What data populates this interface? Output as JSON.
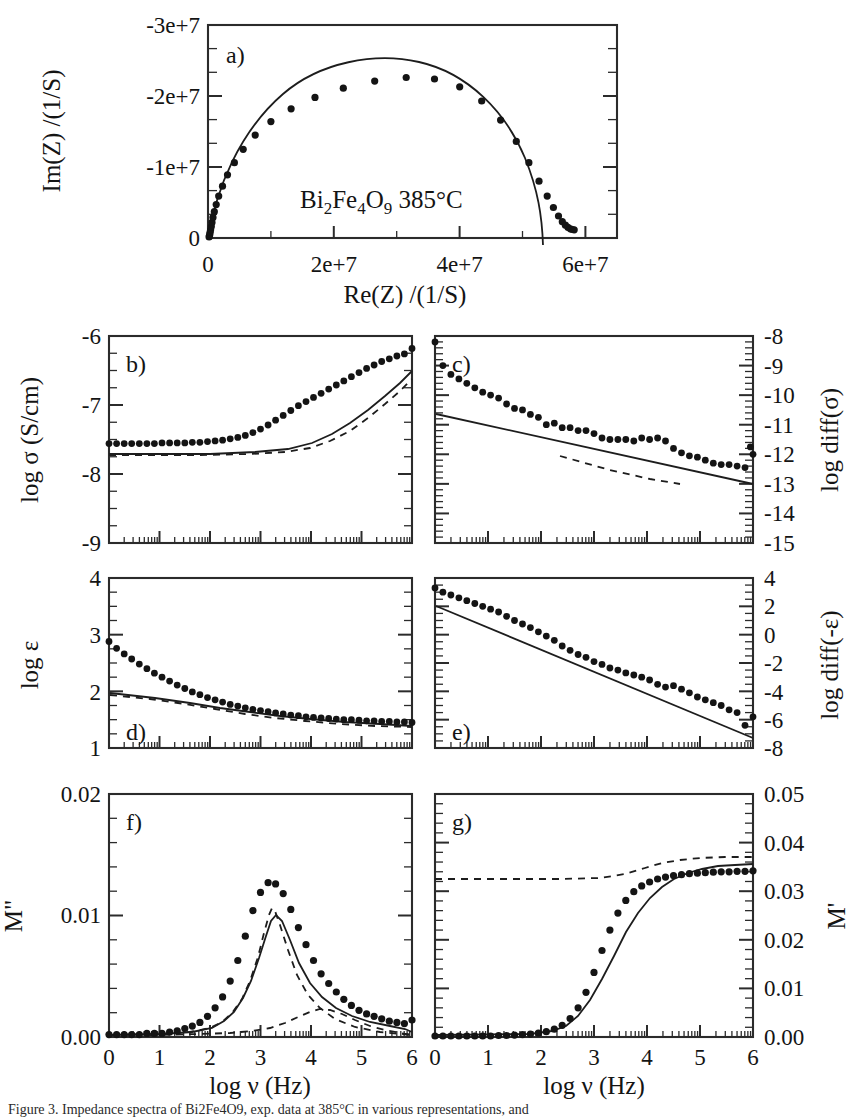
{
  "figure": {
    "caption": "Figure 3. Impedance spectra of Bi2Fe4O9, exp. data at 385°C in various representations, and",
    "sample_annotation": "Bi2Fe4O9 385°C",
    "sample_annotation_parts": {
      "e1": "Bi",
      "s1": "2",
      "e2": "Fe",
      "s2": "4",
      "e3": "O",
      "s3": "9",
      "temp": " 385°C"
    }
  },
  "chart_data": [
    {
      "id": "a",
      "tag": "a)",
      "type": "scatter",
      "title": "",
      "xlabel": "Re(Z) /(1/S)",
      "ylabel": "Im(Z) /(1/S)",
      "xlim": [
        0,
        65000000
      ],
      "ylim": [
        0,
        -30000000
      ],
      "xticks": [
        0,
        20000000,
        40000000,
        60000000
      ],
      "xticklabels": [
        "0",
        "2e+7",
        "4e+7",
        "6e+7"
      ],
      "yticks": [
        0,
        -10000000,
        -20000000,
        -30000000
      ],
      "yticklabels": [
        "0",
        "-1e+7",
        "-2e+7",
        "-3e+7"
      ],
      "grid": false,
      "legend": "none",
      "series": [
        {
          "name": "experimental data",
          "style": "points",
          "x": [
            180000,
            220000,
            280000,
            340000,
            420000,
            520000,
            640000,
            800000,
            1000000,
            1300000,
            1700000,
            2300000,
            3100000,
            4200000,
            5600000,
            7500000,
            10000000,
            13200000,
            17000000,
            21500000,
            26500000,
            31500000,
            36000000,
            40000000,
            43500000,
            46500000,
            49000000,
            51000000,
            52600000,
            53900000,
            54900000,
            55700000,
            56300000,
            56800000,
            57200000,
            57600000,
            57900000,
            58200000
          ],
          "y": [
            -150000,
            -300000,
            -500000,
            -800000,
            -1150000,
            -1600000,
            -2200000,
            -2900000,
            -3700000,
            -4700000,
            -5900000,
            -7300000,
            -8900000,
            -10600000,
            -12500000,
            -14500000,
            -16400000,
            -18200000,
            -19800000,
            -21100000,
            -22100000,
            -22600000,
            -22400000,
            -21300000,
            -19300000,
            -16600000,
            -13600000,
            -10600000,
            -8000000,
            -5900000,
            -4300000,
            -3100000,
            -2300000,
            -1800000,
            -1500000,
            -1300000,
            -1200000,
            -1150000
          ]
        },
        {
          "name": "fit (semicircle)",
          "style": "solid-line",
          "description": "depressed semicircle fit, intercepts near 0 and 5.3e+7, apex -2.25e+7 at 2.7e+7"
        }
      ]
    },
    {
      "id": "b",
      "tag": "b)",
      "type": "scatter",
      "xlabel": "log ν (Hz)",
      "ylabel": "log σ (S/cm)",
      "xlim": [
        0,
        6
      ],
      "ylim": [
        -9,
        -6
      ],
      "xticks": [
        0,
        1,
        2,
        3,
        4,
        5,
        6
      ],
      "xticklabels": [
        "0",
        "1",
        "2",
        "3",
        "4",
        "5",
        "6"
      ],
      "yticks": [
        -9,
        -8,
        -7,
        -6
      ],
      "yticklabels": [
        "-9",
        "-8",
        "-7",
        "-6"
      ],
      "grid": false,
      "series": [
        {
          "name": "experimental data",
          "style": "points",
          "x": [
            0.0,
            0.15,
            0.3,
            0.45,
            0.6,
            0.75,
            0.9,
            1.05,
            1.2,
            1.35,
            1.5,
            1.65,
            1.8,
            1.95,
            2.1,
            2.25,
            2.4,
            2.55,
            2.7,
            2.85,
            3.0,
            3.15,
            3.3,
            3.45,
            3.6,
            3.75,
            3.9,
            4.05,
            4.2,
            4.35,
            4.5,
            4.65,
            4.8,
            4.95,
            5.1,
            5.25,
            5.4,
            5.55,
            5.7,
            5.85,
            6.0
          ],
          "y": [
            -7.56,
            -7.56,
            -7.56,
            -7.56,
            -7.56,
            -7.56,
            -7.56,
            -7.55,
            -7.55,
            -7.55,
            -7.55,
            -7.54,
            -7.54,
            -7.53,
            -7.52,
            -7.51,
            -7.49,
            -7.47,
            -7.44,
            -7.4,
            -7.35,
            -7.29,
            -7.22,
            -7.15,
            -7.08,
            -7.01,
            -6.95,
            -6.89,
            -6.83,
            -6.77,
            -6.71,
            -6.65,
            -6.59,
            -6.53,
            -6.47,
            -6.42,
            -6.37,
            -6.33,
            -6.29,
            -6.26,
            -6.18
          ]
        },
        {
          "name": "fit",
          "style": "solid-line"
        },
        {
          "name": "model component",
          "style": "dashed-line"
        }
      ]
    },
    {
      "id": "c",
      "tag": "c)",
      "type": "scatter",
      "xlabel": "log ν (Hz)",
      "ylabel": "log diff(σ)",
      "xlim": [
        0,
        6
      ],
      "ylim": [
        -15,
        -8
      ],
      "xticks": [
        0,
        1,
        2,
        3,
        4,
        5,
        6
      ],
      "xticklabels": [
        "0",
        "1",
        "2",
        "3",
        "4",
        "5",
        "6"
      ],
      "yticks": [
        -15,
        -14,
        -13,
        -12,
        -11,
        -10,
        -9,
        -8
      ],
      "yticklabels": [
        "-15",
        "-14",
        "-13",
        "-12",
        "-11",
        "-10",
        "-9",
        "-8"
      ],
      "grid": false,
      "series": [
        {
          "name": "experimental data",
          "style": "points",
          "x": [
            0.0,
            0.15,
            0.3,
            0.45,
            0.6,
            0.75,
            0.9,
            1.05,
            1.2,
            1.35,
            1.5,
            1.65,
            1.8,
            1.95,
            2.1,
            2.25,
            2.4,
            2.55,
            2.7,
            2.85,
            3.0,
            3.15,
            3.3,
            3.45,
            3.6,
            3.75,
            3.9,
            4.05,
            4.2,
            4.35,
            4.5,
            4.65,
            4.8,
            4.95,
            5.1,
            5.25,
            5.4,
            5.55,
            5.7,
            5.85,
            5.95,
            6.0
          ],
          "y": [
            -8.2,
            -9.0,
            -9.3,
            -9.45,
            -9.6,
            -9.75,
            -9.9,
            -10.0,
            -10.1,
            -10.3,
            -10.45,
            -10.5,
            -10.65,
            -10.75,
            -11.0,
            -10.95,
            -11.1,
            -11.1,
            -11.2,
            -11.2,
            -11.3,
            -11.45,
            -11.5,
            -11.5,
            -11.5,
            -11.55,
            -11.45,
            -11.5,
            -11.45,
            -11.55,
            -11.8,
            -11.95,
            -12.05,
            -12.1,
            -12.2,
            -12.3,
            -12.35,
            -12.35,
            -12.4,
            -12.45,
            -11.75,
            -12.0
          ]
        },
        {
          "name": "fit",
          "style": "solid-line"
        },
        {
          "name": "model component",
          "style": "dashed-line"
        }
      ]
    },
    {
      "id": "d",
      "tag": "d)",
      "type": "scatter",
      "xlabel": "log ν (Hz)",
      "ylabel": "log ε",
      "xlim": [
        0,
        6
      ],
      "ylim": [
        1,
        4
      ],
      "xticks": [
        0,
        1,
        2,
        3,
        4,
        5,
        6
      ],
      "xticklabels": [
        "0",
        "1",
        "2",
        "3",
        "4",
        "5",
        "6"
      ],
      "yticks": [
        1,
        2,
        3,
        4
      ],
      "yticklabels": [
        "1",
        "2",
        "3",
        "4"
      ],
      "grid": false,
      "series": [
        {
          "name": "experimental data",
          "style": "points",
          "x": [
            0.0,
            0.15,
            0.3,
            0.45,
            0.6,
            0.75,
            0.9,
            1.05,
            1.2,
            1.35,
            1.5,
            1.65,
            1.8,
            1.95,
            2.1,
            2.25,
            2.4,
            2.55,
            2.7,
            2.85,
            3.0,
            3.15,
            3.3,
            3.45,
            3.6,
            3.75,
            3.9,
            4.05,
            4.2,
            4.35,
            4.5,
            4.65,
            4.8,
            4.95,
            5.1,
            5.25,
            5.4,
            5.55,
            5.7,
            5.85,
            6.0
          ],
          "y": [
            2.88,
            2.76,
            2.66,
            2.57,
            2.48,
            2.4,
            2.32,
            2.25,
            2.18,
            2.11,
            2.05,
            1.99,
            1.94,
            1.89,
            1.85,
            1.81,
            1.77,
            1.74,
            1.71,
            1.68,
            1.66,
            1.64,
            1.62,
            1.6,
            1.58,
            1.57,
            1.55,
            1.54,
            1.53,
            1.52,
            1.51,
            1.5,
            1.5,
            1.49,
            1.48,
            1.48,
            1.47,
            1.47,
            1.46,
            1.46,
            1.45
          ]
        },
        {
          "name": "fit",
          "style": "solid-line"
        },
        {
          "name": "model component",
          "style": "dashed-line"
        }
      ]
    },
    {
      "id": "e",
      "tag": "e)",
      "type": "scatter",
      "xlabel": "log ν (Hz)",
      "ylabel": "log diff(-ε)",
      "xlim": [
        0,
        6
      ],
      "ylim": [
        -8,
        4
      ],
      "xticks": [
        0,
        1,
        2,
        3,
        4,
        5,
        6
      ],
      "xticklabels": [
        "0",
        "1",
        "2",
        "3",
        "4",
        "5",
        "6"
      ],
      "yticks": [
        -8,
        -6,
        -4,
        -2,
        0,
        2,
        4
      ],
      "yticklabels": [
        "-8",
        "-6",
        "-4",
        "-2",
        "0",
        "2",
        "4"
      ],
      "grid": false,
      "series": [
        {
          "name": "experimental data",
          "style": "points",
          "x": [
            0.0,
            0.15,
            0.3,
            0.45,
            0.6,
            0.75,
            0.9,
            1.05,
            1.2,
            1.35,
            1.5,
            1.65,
            1.8,
            1.95,
            2.1,
            2.25,
            2.4,
            2.55,
            2.7,
            2.85,
            3.0,
            3.15,
            3.3,
            3.45,
            3.6,
            3.75,
            3.9,
            4.05,
            4.2,
            4.35,
            4.5,
            4.65,
            4.8,
            4.95,
            5.1,
            5.25,
            5.4,
            5.55,
            5.7,
            5.85,
            6.0
          ],
          "y": [
            3.3,
            3.0,
            2.8,
            2.6,
            2.4,
            2.2,
            2.0,
            1.8,
            1.6,
            1.3,
            1.0,
            0.75,
            0.5,
            0.2,
            -0.1,
            -0.4,
            -0.8,
            -1.1,
            -1.4,
            -1.6,
            -1.9,
            -2.1,
            -2.35,
            -2.5,
            -2.7,
            -2.85,
            -3.0,
            -3.2,
            -3.5,
            -3.7,
            -3.6,
            -3.85,
            -4.1,
            -4.4,
            -4.6,
            -4.8,
            -5.0,
            -5.3,
            -5.5,
            -6.4,
            -5.8
          ]
        },
        {
          "name": "fit",
          "style": "solid-line"
        }
      ]
    },
    {
      "id": "f",
      "tag": "f)",
      "type": "scatter",
      "xlabel": "log ν (Hz)",
      "ylabel": "M\"",
      "xlim": [
        0,
        6
      ],
      "ylim": [
        0.0,
        0.02
      ],
      "xticks": [
        0,
        1,
        2,
        3,
        4,
        5,
        6
      ],
      "xticklabels": [
        "0",
        "1",
        "2",
        "3",
        "4",
        "5",
        "6"
      ],
      "yticks": [
        0.0,
        0.01,
        0.02
      ],
      "yticklabels": [
        "0.00",
        "0.01",
        "0.02"
      ],
      "grid": false,
      "series": [
        {
          "name": "experimental data",
          "style": "points",
          "x": [
            0.0,
            0.15,
            0.3,
            0.45,
            0.6,
            0.75,
            0.9,
            1.05,
            1.2,
            1.35,
            1.5,
            1.65,
            1.8,
            1.95,
            2.1,
            2.25,
            2.4,
            2.55,
            2.7,
            2.85,
            3.0,
            3.15,
            3.3,
            3.45,
            3.6,
            3.75,
            3.9,
            4.05,
            4.2,
            4.35,
            4.5,
            4.65,
            4.8,
            4.95,
            5.1,
            5.25,
            5.4,
            5.55,
            5.7,
            5.85,
            6.0
          ],
          "y": [
            0.0002,
            0.0002,
            0.0002,
            0.0002,
            0.0002,
            0.0003,
            0.0003,
            0.0003,
            0.0004,
            0.0005,
            0.0007,
            0.0009,
            0.0012,
            0.0017,
            0.0024,
            0.0033,
            0.0046,
            0.0063,
            0.0083,
            0.0104,
            0.0119,
            0.0127,
            0.0126,
            0.0118,
            0.0105,
            0.009,
            0.0076,
            0.0063,
            0.0052,
            0.0044,
            0.0037,
            0.0031,
            0.0026,
            0.0022,
            0.0019,
            0.0017,
            0.0015,
            0.0013,
            0.0012,
            0.0011,
            0.0014
          ]
        },
        {
          "name": "fit (total)",
          "style": "solid-line"
        },
        {
          "name": "component 1",
          "style": "dashed-line"
        },
        {
          "name": "component 2",
          "style": "dashed-line",
          "description": "small secondary peak near log v = 4.4, height ~0.0017"
        }
      ]
    },
    {
      "id": "g",
      "tag": "g)",
      "type": "scatter",
      "xlabel": "log ν (Hz)",
      "ylabel": "M'",
      "xlim": [
        0,
        6
      ],
      "ylim": [
        0.0,
        0.05
      ],
      "xticks": [
        0,
        1,
        2,
        3,
        4,
        5,
        6
      ],
      "xticklabels": [
        "0",
        "1",
        "2",
        "3",
        "4",
        "5",
        "6"
      ],
      "yticks": [
        0.0,
        0.01,
        0.02,
        0.03,
        0.04,
        0.05
      ],
      "yticklabels": [
        "0.00",
        "0.01",
        "0.02",
        "0.03",
        "0.04",
        "0.05"
      ],
      "grid": false,
      "series": [
        {
          "name": "experimental data",
          "style": "points",
          "x": [
            0.0,
            0.15,
            0.3,
            0.45,
            0.6,
            0.75,
            0.9,
            1.05,
            1.2,
            1.35,
            1.5,
            1.65,
            1.8,
            1.95,
            2.1,
            2.25,
            2.4,
            2.55,
            2.7,
            2.85,
            3.0,
            3.15,
            3.3,
            3.45,
            3.6,
            3.75,
            3.9,
            4.05,
            4.2,
            4.35,
            4.5,
            4.65,
            4.8,
            4.95,
            5.1,
            5.25,
            5.4,
            5.55,
            5.7,
            5.85,
            6.0
          ],
          "y": [
            0.0002,
            0.0002,
            0.0002,
            0.0002,
            0.0002,
            0.0002,
            0.0002,
            0.0002,
            0.0003,
            0.0003,
            0.0004,
            0.0005,
            0.0006,
            0.0008,
            0.0011,
            0.0016,
            0.0024,
            0.0038,
            0.006,
            0.0092,
            0.0133,
            0.0178,
            0.022,
            0.0255,
            0.0281,
            0.0299,
            0.0311,
            0.0319,
            0.0325,
            0.0329,
            0.0332,
            0.0334,
            0.0336,
            0.0337,
            0.0338,
            0.0339,
            0.034,
            0.034,
            0.0341,
            0.0341,
            0.0342
          ]
        },
        {
          "name": "fit (total)",
          "style": "solid-line"
        },
        {
          "name": "model component",
          "style": "dashed-line",
          "description": "plateau at ~0.0325 rising to ~0.0350 near log v = 5"
        }
      ]
    }
  ]
}
